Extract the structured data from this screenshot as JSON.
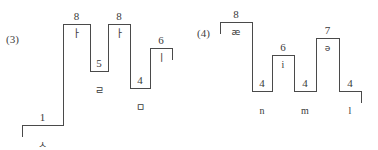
{
  "figure": {
    "background_color": "#ffffff",
    "stroke_color": "#4a4a4a",
    "text_color": "#3a3a3a",
    "width": 378,
    "height": 150
  },
  "panels": [
    {
      "index_label": "(3)",
      "script": "korean-jamo",
      "segments": [
        {
          "level": "1",
          "symbol": "ㅅ",
          "symbol_position": "below",
          "plateau": {
            "x1": 22,
            "x2": 63,
            "y": 125
          }
        },
        {
          "level": "8",
          "symbol": "ㅏ",
          "symbol_position": "inside",
          "plateau": {
            "x1": 63,
            "x2": 90,
            "y": 24
          }
        },
        {
          "level": "5",
          "symbol": "ㄹ",
          "symbol_position": "below",
          "plateau": {
            "x1": 90,
            "x2": 108,
            "y": 71
          }
        },
        {
          "level": "8",
          "symbol": "ㅏ",
          "symbol_position": "inside",
          "plateau": {
            "x1": 108,
            "x2": 130,
            "y": 24
          }
        },
        {
          "level": "4",
          "symbol": "ㅁ",
          "symbol_position": "below",
          "plateau": {
            "x1": 130,
            "x2": 150,
            "y": 88
          }
        },
        {
          "level": "6",
          "symbol": "ㅣ",
          "symbol_position": "inside",
          "plateau": {
            "x1": 150,
            "x2": 172,
            "y": 48
          }
        }
      ]
    },
    {
      "index_label": "(4)",
      "script": "ipa",
      "segments": [
        {
          "level": "8",
          "symbol": "æ",
          "symbol_position": "inside",
          "plateau": {
            "x1": 31,
            "x2": 63,
            "y": 22
          }
        },
        {
          "level": "4",
          "symbol": "n",
          "symbol_position": "below",
          "plateau": {
            "x1": 63,
            "x2": 83,
            "y": 91
          }
        },
        {
          "level": "6",
          "symbol": "i",
          "symbol_position": "inside",
          "plateau": {
            "x1": 83,
            "x2": 105,
            "y": 55
          }
        },
        {
          "level": "4",
          "symbol": "m",
          "symbol_position": "below",
          "plateau": {
            "x1": 105,
            "x2": 127,
            "y": 91
          }
        },
        {
          "level": "7",
          "symbol": "ə",
          "symbol_position": "inside",
          "plateau": {
            "x1": 127,
            "x2": 150,
            "y": 38
          }
        },
        {
          "level": "4",
          "symbol": "l",
          "symbol_position": "below",
          "plateau": {
            "x1": 150,
            "x2": 172,
            "y": 91
          }
        }
      ]
    }
  ]
}
